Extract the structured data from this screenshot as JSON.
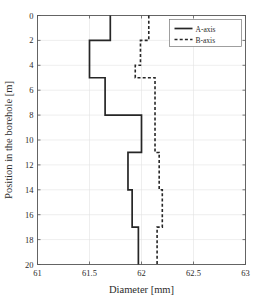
{
  "chart_data": {
    "type": "line",
    "title": "",
    "xlabel": "Diameter [mm]",
    "ylabel": "Position in the borehole [m]",
    "xlim": [
      61,
      63
    ],
    "ylim": [
      0,
      20
    ],
    "y_inverted": true,
    "grid": true,
    "xticks": [
      61,
      61.5,
      62,
      62.5,
      63
    ],
    "xtick_labels": [
      "61",
      "61.5",
      "62",
      "62.5",
      "63"
    ],
    "yticks": [
      0,
      2,
      4,
      6,
      8,
      10,
      12,
      14,
      16,
      18,
      20
    ],
    "ytick_labels": [
      "0",
      "2",
      "4",
      "6",
      "8",
      "10",
      "12",
      "14",
      "16",
      "18",
      "20"
    ],
    "legend_position": "upper right",
    "series": [
      {
        "name": "A-axis",
        "style": "solid",
        "color": "#262626",
        "step": "horizontal-then-vertical",
        "depth_intervals": [
          [
            0,
            2
          ],
          [
            2,
            5
          ],
          [
            5,
            8
          ],
          [
            8,
            11
          ],
          [
            11,
            14
          ],
          [
            14,
            17
          ],
          [
            17,
            20
          ]
        ],
        "values": [
          61.7,
          61.5,
          61.65,
          62.0,
          61.87,
          61.91,
          61.97
        ]
      },
      {
        "name": "B-axis",
        "style": "dashed",
        "color": "#262626",
        "step": "horizontal-then-vertical",
        "depth_intervals": [
          [
            0,
            2
          ],
          [
            2,
            4
          ],
          [
            4,
            5
          ],
          [
            5,
            11
          ],
          [
            11,
            14
          ],
          [
            14,
            17
          ],
          [
            17,
            20
          ]
        ],
        "values": [
          62.07,
          61.99,
          61.94,
          62.13,
          62.17,
          62.2,
          62.15
        ]
      }
    ]
  },
  "legend": {
    "entries": [
      {
        "label": "A-axis"
      },
      {
        "label": "B-axis"
      }
    ]
  },
  "axes": {
    "x_title": "Diameter [mm]",
    "y_title": "Position in the borehole [m]"
  }
}
